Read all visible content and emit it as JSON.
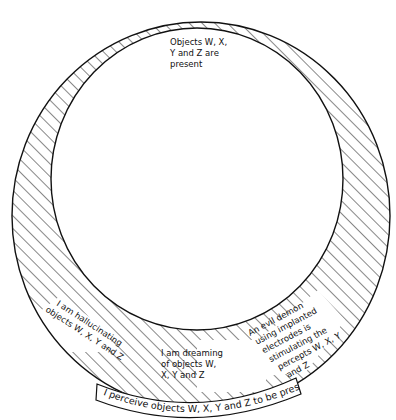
{
  "diagram": {
    "type": "nested-circles",
    "inner_region": {
      "label_lines": [
        "Objects W, X,",
        "Y and Z are",
        "present"
      ]
    },
    "outer_ring": {
      "fill": "hatched",
      "labels": {
        "hallucinating": [
          "I am hallucinating",
          "objects W, X, Y and Z"
        ],
        "dreaming": [
          "I am dreaming",
          "of objects W,",
          "X, Y and Z"
        ],
        "demon": [
          "An evil demon",
          "using implanted",
          "electrodes is",
          "stimulating the",
          "percepts W, X, Y",
          "and Z"
        ]
      }
    },
    "banner": {
      "label": "I perceive objects W, X, Y and Z to be present"
    },
    "colors": {
      "line": "#111111",
      "background": "#ffffff"
    }
  }
}
